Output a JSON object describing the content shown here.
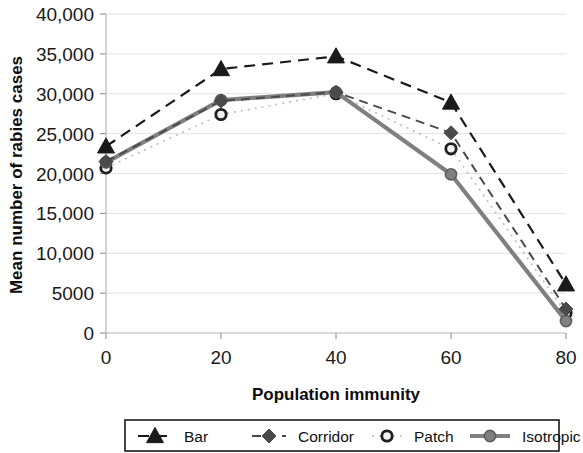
{
  "chart_data": {
    "type": "line",
    "title": "",
    "xlabel": "Population immunity",
    "ylabel": "Mean number of rabies cases",
    "x": [
      0,
      20,
      40,
      60,
      80
    ],
    "xticklabels": [
      "0",
      "20",
      "40",
      "60",
      "80"
    ],
    "yticklabels": [
      "0",
      "5000",
      "10,000",
      "15,000",
      "20,000",
      "25,000",
      "30,000",
      "35,000",
      "40,000"
    ],
    "yticks": [
      0,
      5000,
      10000,
      15000,
      20000,
      25000,
      30000,
      35000,
      40000
    ],
    "xlim": [
      0,
      80
    ],
    "ylim": [
      0,
      40000
    ],
    "grid": "horizontal",
    "legend_position": "bottom",
    "series": [
      {
        "name": "Bar",
        "values": [
          23400,
          33100,
          34700,
          28900,
          6100
        ],
        "color": "#1a1a1a",
        "marker": "triangle",
        "linestyle": "dashed",
        "linewidth": 2.2
      },
      {
        "name": "Corridor",
        "values": [
          21500,
          29100,
          30200,
          25100,
          3000
        ],
        "color": "#4a4a4a",
        "marker": "diamond",
        "linestyle": "dashed",
        "linewidth": 2.0
      },
      {
        "name": "Patch",
        "values": [
          20700,
          27400,
          30000,
          23100,
          2500
        ],
        "color": "#bdbdbd",
        "marker": "circle-ring",
        "linestyle": "dotted",
        "linewidth": 1.6
      },
      {
        "name": "Isotropic",
        "values": [
          21400,
          29200,
          30200,
          19900,
          1500
        ],
        "color": "#808080",
        "marker": "circle",
        "linestyle": "solid",
        "linewidth": 4.2
      }
    ]
  },
  "legend": {
    "entries": [
      {
        "label": "Bar"
      },
      {
        "label": "Corridor"
      },
      {
        "label": "Patch"
      },
      {
        "label": "Isotropic"
      }
    ]
  }
}
